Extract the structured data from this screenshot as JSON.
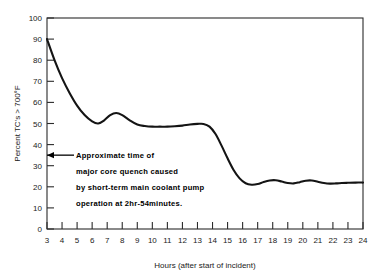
{
  "chart_data": {
    "type": "line",
    "title": "",
    "xlabel": "Hours (after start of incident)",
    "ylabel": "Percent TC's > 700°F",
    "xlim": [
      3,
      24
    ],
    "ylim": [
      0,
      100
    ],
    "xticks": [
      3,
      4,
      5,
      6,
      7,
      8,
      9,
      10,
      11,
      12,
      13,
      14,
      15,
      16,
      17,
      18,
      19,
      20,
      21,
      22,
      23,
      24
    ],
    "yticks": [
      0,
      10,
      20,
      30,
      40,
      50,
      60,
      70,
      80,
      90,
      100
    ],
    "xtick_labels": [
      "3",
      "4",
      "5",
      "6",
      "7",
      "8",
      "9",
      "10",
      "11",
      "12",
      "13",
      "14",
      "15",
      "16",
      "17",
      "18",
      "19",
      "20",
      "21",
      "22",
      "23",
      "24"
    ],
    "ytick_labels": [
      "0",
      "10",
      "20",
      "30",
      "40",
      "50",
      "60",
      "70",
      "80",
      "90",
      "100"
    ],
    "grid": false,
    "legend": "none",
    "series": [
      {
        "name": "Percent TC's > 700F",
        "color": "#141414",
        "x": [
          3.0,
          3.5,
          4.0,
          4.5,
          5.0,
          5.5,
          6.0,
          6.4,
          6.8,
          7.2,
          7.6,
          8.0,
          8.5,
          9.0,
          9.5,
          10.0,
          10.5,
          11.0,
          11.5,
          12.0,
          12.5,
          13.0,
          13.4,
          13.8,
          14.2,
          14.6,
          15.0,
          15.4,
          15.8,
          16.2,
          16.6,
          17.0,
          17.4,
          17.8,
          18.2,
          18.6,
          19.0,
          19.4,
          19.8,
          20.2,
          20.6,
          21.0,
          21.4,
          21.8,
          22.2,
          22.6,
          23.0,
          23.5,
          24.0
        ],
        "y": [
          90.0,
          80.0,
          71.5,
          64.5,
          58.5,
          54.0,
          51.0,
          50.0,
          51.5,
          54.0,
          55.0,
          54.0,
          51.5,
          49.5,
          48.8,
          48.5,
          48.5,
          48.5,
          48.7,
          49.0,
          49.5,
          49.8,
          49.8,
          48.5,
          45.0,
          39.5,
          33.5,
          28.0,
          24.0,
          21.7,
          21.0,
          21.3,
          22.3,
          23.0,
          23.1,
          22.5,
          21.8,
          21.6,
          22.2,
          22.9,
          23.0,
          22.4,
          21.8,
          21.5,
          21.6,
          21.8,
          21.9,
          22.0,
          22.0
        ]
      }
    ],
    "annotations": [
      {
        "name": "quench-annotation",
        "arrow_at_y": 35,
        "lines": [
          "Approximate time of",
          "major core quench caused",
          "by short-term main coolant pump",
          "operation at 2hr-54minutes."
        ]
      }
    ]
  },
  "axes": {
    "ylabel": "Percent TC's > 700°F",
    "xlabel": "Hours (after start of incident)"
  },
  "annotation": {
    "line1": "Approximate time of",
    "line2": "major core quench caused",
    "line3": "by short-term main coolant pump",
    "line4": "operation at 2hr-54minutes."
  },
  "colors": {
    "curve": "#141414",
    "axis": "#2b2b2b",
    "background": "#ffffff",
    "text": "#1a1a1a"
  }
}
